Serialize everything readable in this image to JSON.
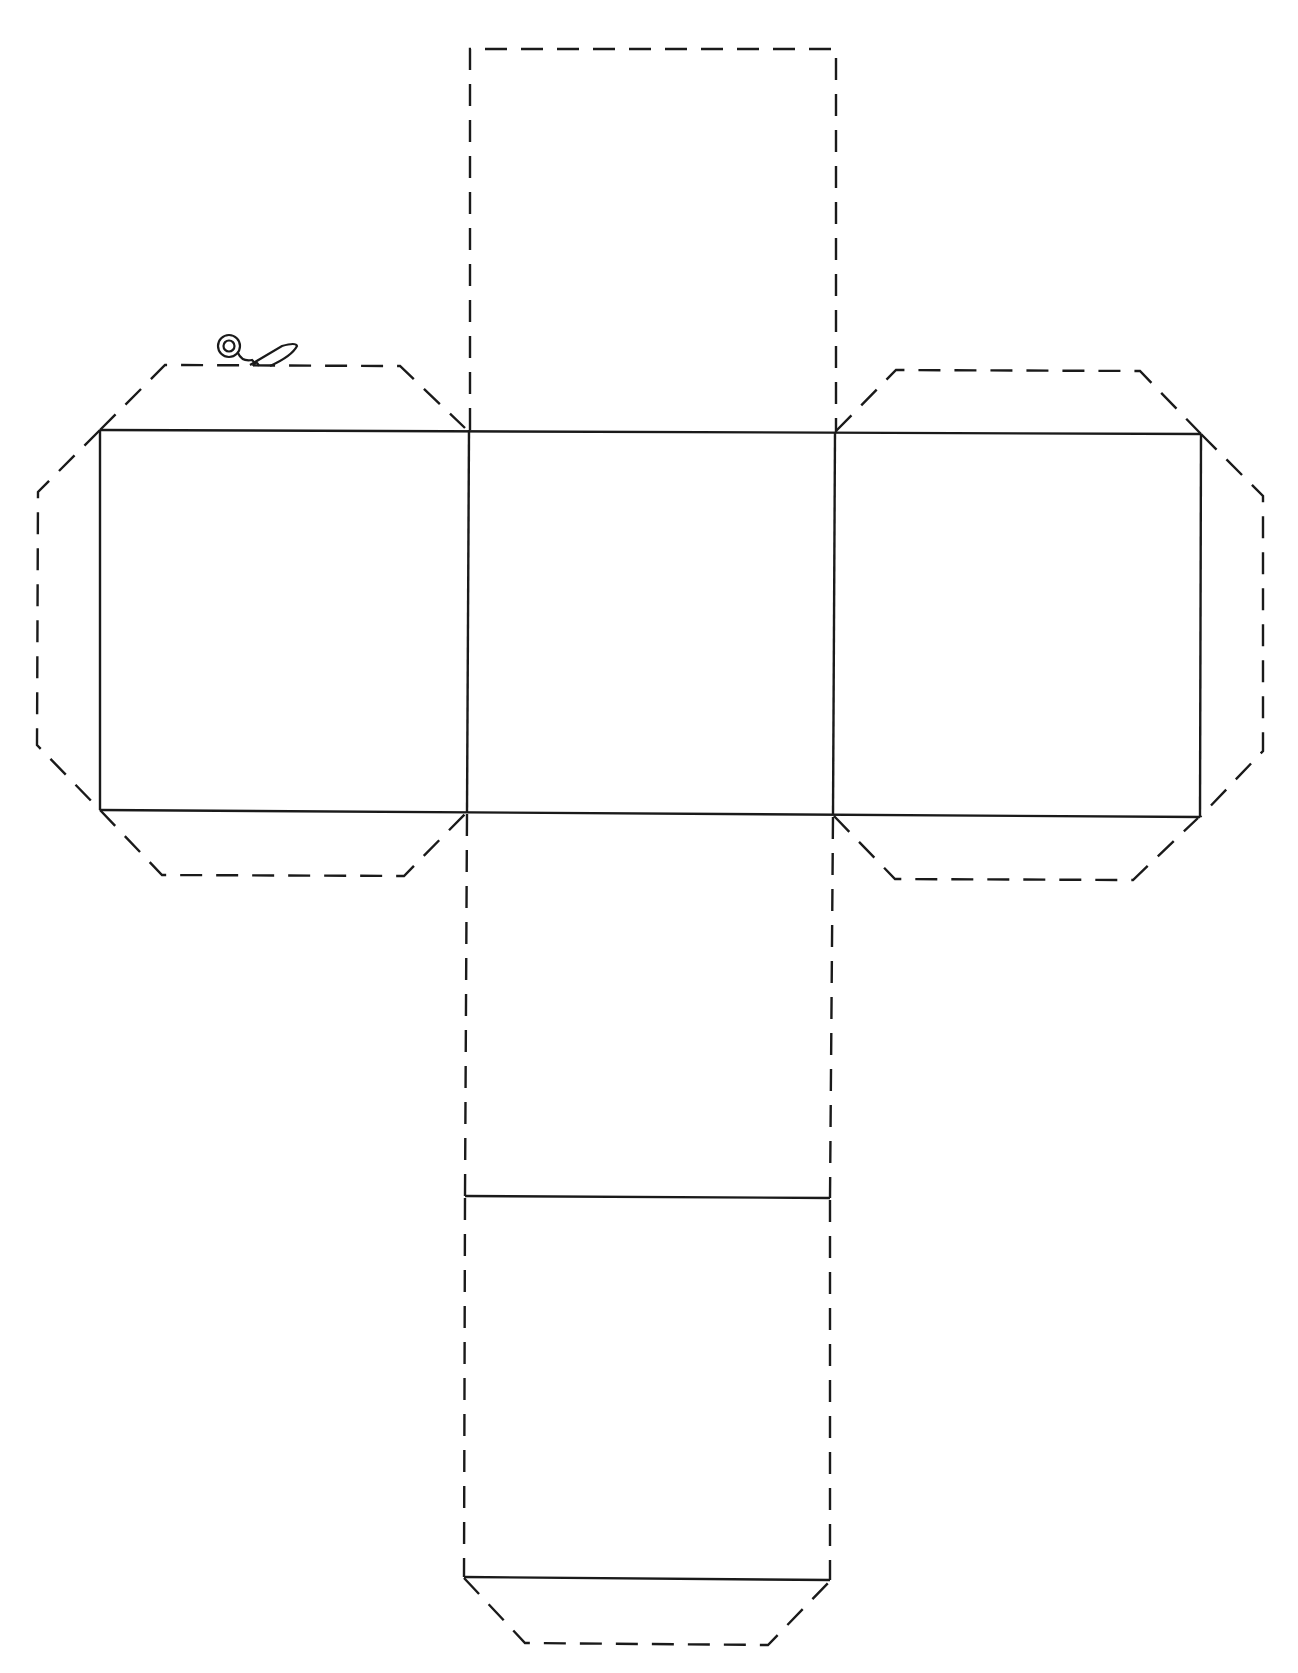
{
  "title": "",
  "diagram": {
    "type": "cube-net",
    "legend": {
      "fold_line": "solid",
      "cut_line": "dashed"
    },
    "icons": [
      "scissors-icon"
    ],
    "faces": [
      {
        "name": "top-face",
        "style": "dashed"
      },
      {
        "name": "left-face",
        "style": "solid"
      },
      {
        "name": "center-face",
        "style": "solid"
      },
      {
        "name": "right-face",
        "style": "solid"
      },
      {
        "name": "lower-face",
        "style": "dashed-sides"
      },
      {
        "name": "bottom-face",
        "style": "dashed-sides"
      }
    ],
    "tabs": [
      "left-top-tab",
      "left-bottom-tab",
      "left-side-tab",
      "right-top-tab",
      "right-bottom-tab",
      "right-side-tab",
      "bottom-tab"
    ],
    "colors": {
      "line": "#1a1a1a",
      "background": "#ffffff"
    }
  }
}
